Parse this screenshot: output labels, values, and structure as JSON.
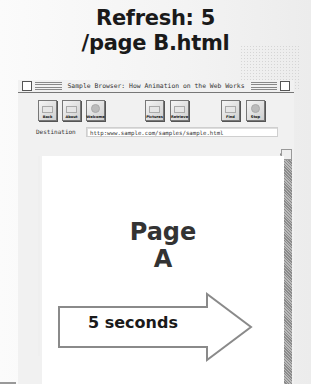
{
  "caption": {
    "line1": "Refresh: 5",
    "line2": "/page B.html"
  },
  "browser": {
    "window_title": "Sample Browser: How Animation on the Web Works",
    "toolbar": {
      "buttons": [
        {
          "label": "Back",
          "icon": "back-icon"
        },
        {
          "label": "About",
          "icon": "about-icon"
        },
        {
          "label": "Welcome",
          "icon": "welcome-icon"
        },
        {
          "label": "Pictures",
          "icon": "pictures-icon"
        },
        {
          "label": "Retrieve",
          "icon": "retrieve-icon"
        },
        {
          "label": "Find",
          "icon": "find-icon"
        },
        {
          "label": "Stop",
          "icon": "stop-icon"
        }
      ]
    },
    "destination": {
      "label": "Destination",
      "value": "http:www.sample.com/samples/sample.html"
    },
    "page": {
      "line1": "Page",
      "line2": "A"
    }
  },
  "timer_arrow": {
    "label": "5 seconds"
  },
  "colors": {
    "text": "#1a1a1a",
    "page_text": "#333333",
    "scrollbar": "#9a9a9a"
  }
}
